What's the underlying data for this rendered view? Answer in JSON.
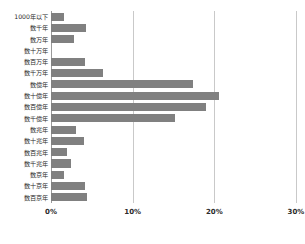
{
  "chart": {
    "title": "",
    "axis": {
      "x_ticks": [
        "0%",
        "10%",
        "20%",
        "30%"
      ],
      "gridlines": true,
      "bar_color": "#808080",
      "grid_color": "#c9c9c9"
    }
  },
  "chart_data": {
    "type": "bar",
    "orientation": "horizontal",
    "title": "",
    "xlabel": "",
    "ylabel": "",
    "xlim": [
      0,
      30
    ],
    "x_ticks": [
      0,
      10,
      20,
      30
    ],
    "x_tick_labels": [
      "0%",
      "10%",
      "20%",
      "30%"
    ],
    "grid": true,
    "legend": "none",
    "bar_color": "#808080",
    "categories": [
      "1000年以下",
      "数千年",
      "数万年",
      "数十万年",
      "数百万年",
      "数千万年",
      "数億年",
      "数十億年",
      "数百億年",
      "数千億年",
      "数兆年",
      "数十兆年",
      "数百兆年",
      "数千兆年",
      "数京年",
      "数十京年",
      "数百京年"
    ],
    "values": [
      1.6,
      4.3,
      2.8,
      0.0,
      4.2,
      6.4,
      17.4,
      20.6,
      19.0,
      15.2,
      3.0,
      4.0,
      2.0,
      2.4,
      1.6,
      4.2,
      4.4
    ]
  }
}
